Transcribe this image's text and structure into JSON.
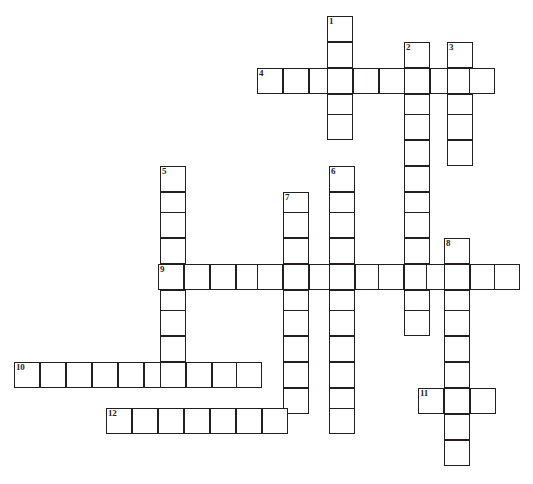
{
  "puzzle": {
    "title": "Crossword Puzzle Grid",
    "cell_size": 26,
    "grid_origin": {
      "x": 14,
      "y": 16
    },
    "colors": {
      "cell_border": "#231f20",
      "cell_fill": "#ffffff",
      "page_background": "#ffffff",
      "number_text": "#231f20"
    },
    "clue_numbers": [
      "1",
      "2",
      "3",
      "4",
      "5",
      "6",
      "7",
      "8",
      "9",
      "10",
      "11",
      "12"
    ],
    "entries": [
      {
        "number": "1",
        "direction": "down",
        "length": 5,
        "start_x": 327,
        "start_y": 16,
        "cells": [
          "",
          "",
          "",
          "",
          ""
        ]
      },
      {
        "number": "2",
        "direction": "down",
        "length": 11,
        "start_x": 404,
        "start_y": 42,
        "cells": [
          "",
          "",
          "",
          "",
          "",
          "",
          "",
          "",
          "",
          "",
          ""
        ]
      },
      {
        "number": "3",
        "direction": "down",
        "length": 5,
        "start_x": 447,
        "start_y": 42,
        "cells": [
          "",
          "",
          "",
          "",
          ""
        ]
      },
      {
        "number": "4",
        "direction": "across",
        "length": 9,
        "start_x": 257,
        "start_y": 68,
        "cells": [
          "",
          "",
          "",
          "",
          "",
          "",
          "",
          "",
          ""
        ]
      },
      {
        "number": "5",
        "direction": "down",
        "length": 9,
        "start_x": 160,
        "start_y": 166,
        "cells": [
          "",
          "",
          "",
          "",
          "",
          "",
          "",
          "",
          ""
        ]
      },
      {
        "number": "6",
        "direction": "down",
        "length": 11,
        "start_x": 329,
        "start_y": 166,
        "cells": [
          "",
          "",
          "",
          "",
          "",
          "",
          "",
          "",
          "",
          "",
          ""
        ]
      },
      {
        "number": "7",
        "direction": "down",
        "length": 9,
        "start_x": 283,
        "start_y": 192,
        "cells": [
          "",
          "",
          "",
          "",
          "",
          "",
          "",
          "",
          ""
        ]
      },
      {
        "number": "8",
        "direction": "down",
        "length": 9,
        "start_x": 444,
        "start_y": 238,
        "cells": [
          "",
          "",
          "",
          "",
          "",
          "",
          "",
          "",
          ""
        ]
      },
      {
        "number": "9",
        "direction": "across",
        "length": 14,
        "start_x": 158,
        "start_y": 264,
        "cells": [
          "",
          "",
          "",
          "",
          "",
          "",
          "",
          "",
          "",
          "",
          "",
          "",
          "",
          ""
        ]
      },
      {
        "number": "10",
        "direction": "across",
        "length": 10,
        "start_x": 14,
        "start_y": 362,
        "cells": [
          "",
          "",
          "",
          "",
          "",
          "",
          "",
          "",
          "",
          ""
        ]
      },
      {
        "number": "11",
        "direction": "across",
        "length": 3,
        "start_x": 418,
        "start_y": 388,
        "cells": [
          "",
          "",
          ""
        ]
      },
      {
        "number": "12",
        "direction": "across",
        "length": 7,
        "start_x": 106,
        "start_y": 408,
        "cells": [
          "",
          "",
          "",
          "",
          "",
          "",
          ""
        ]
      }
    ],
    "cells": [
      {
        "x": 327,
        "y": 16,
        "num": "1"
      },
      {
        "x": 327,
        "y": 42
      },
      {
        "x": 404,
        "y": 42,
        "num": "2"
      },
      {
        "x": 447,
        "y": 42,
        "num": "3"
      },
      {
        "x": 257,
        "y": 68,
        "num": "4"
      },
      {
        "x": 283,
        "y": 68
      },
      {
        "x": 309,
        "y": 68
      },
      {
        "x": 327,
        "y": 68
      },
      {
        "x": 353,
        "y": 68
      },
      {
        "x": 379,
        "y": 68
      },
      {
        "x": 404,
        "y": 68
      },
      {
        "x": 430,
        "y": 68
      },
      {
        "x": 447,
        "y": 68
      },
      {
        "x": 469,
        "y": 68
      },
      {
        "x": 327,
        "y": 94
      },
      {
        "x": 404,
        "y": 94
      },
      {
        "x": 447,
        "y": 94
      },
      {
        "x": 327,
        "y": 114
      },
      {
        "x": 404,
        "y": 114
      },
      {
        "x": 447,
        "y": 114
      },
      {
        "x": 404,
        "y": 140
      },
      {
        "x": 447,
        "y": 140
      },
      {
        "x": 160,
        "y": 166,
        "num": "5"
      },
      {
        "x": 329,
        "y": 166,
        "num": "6"
      },
      {
        "x": 404,
        "y": 166
      },
      {
        "x": 160,
        "y": 192
      },
      {
        "x": 283,
        "y": 192,
        "num": "7"
      },
      {
        "x": 329,
        "y": 192
      },
      {
        "x": 404,
        "y": 192
      },
      {
        "x": 160,
        "y": 212
      },
      {
        "x": 283,
        "y": 212
      },
      {
        "x": 329,
        "y": 212
      },
      {
        "x": 404,
        "y": 212
      },
      {
        "x": 160,
        "y": 238
      },
      {
        "x": 283,
        "y": 238
      },
      {
        "x": 329,
        "y": 238
      },
      {
        "x": 404,
        "y": 238
      },
      {
        "x": 444,
        "y": 238,
        "num": "8"
      },
      {
        "x": 158,
        "y": 264,
        "num": "9"
      },
      {
        "x": 184,
        "y": 264
      },
      {
        "x": 210,
        "y": 264
      },
      {
        "x": 236,
        "y": 264
      },
      {
        "x": 257,
        "y": 264
      },
      {
        "x": 283,
        "y": 264
      },
      {
        "x": 309,
        "y": 264
      },
      {
        "x": 329,
        "y": 264
      },
      {
        "x": 355,
        "y": 264
      },
      {
        "x": 378,
        "y": 264
      },
      {
        "x": 404,
        "y": 264
      },
      {
        "x": 426,
        "y": 264
      },
      {
        "x": 444,
        "y": 264
      },
      {
        "x": 470,
        "y": 264
      },
      {
        "x": 494,
        "y": 264
      },
      {
        "x": 160,
        "y": 290
      },
      {
        "x": 283,
        "y": 290
      },
      {
        "x": 329,
        "y": 290
      },
      {
        "x": 404,
        "y": 290
      },
      {
        "x": 444,
        "y": 290
      },
      {
        "x": 160,
        "y": 310
      },
      {
        "x": 283,
        "y": 310
      },
      {
        "x": 329,
        "y": 310
      },
      {
        "x": 404,
        "y": 310
      },
      {
        "x": 444,
        "y": 310
      },
      {
        "x": 160,
        "y": 336
      },
      {
        "x": 283,
        "y": 336
      },
      {
        "x": 329,
        "y": 336
      },
      {
        "x": 444,
        "y": 336
      },
      {
        "x": 14,
        "y": 362,
        "num": "10"
      },
      {
        "x": 40,
        "y": 362
      },
      {
        "x": 66,
        "y": 362
      },
      {
        "x": 92,
        "y": 362
      },
      {
        "x": 118,
        "y": 362
      },
      {
        "x": 144,
        "y": 362
      },
      {
        "x": 160,
        "y": 362
      },
      {
        "x": 186,
        "y": 362
      },
      {
        "x": 212,
        "y": 362
      },
      {
        "x": 236,
        "y": 362
      },
      {
        "x": 283,
        "y": 362
      },
      {
        "x": 329,
        "y": 362
      },
      {
        "x": 444,
        "y": 362
      },
      {
        "x": 283,
        "y": 388
      },
      {
        "x": 329,
        "y": 388
      },
      {
        "x": 418,
        "y": 388,
        "num": "11"
      },
      {
        "x": 444,
        "y": 388
      },
      {
        "x": 470,
        "y": 388
      },
      {
        "x": 106,
        "y": 408
      },
      {
        "x": 132,
        "y": 408
      },
      {
        "x": 158,
        "y": 408
      },
      {
        "x": 184,
        "y": 408
      },
      {
        "x": 210,
        "y": 408
      },
      {
        "x": 236,
        "y": 408
      },
      {
        "x": 262,
        "y": 408
      },
      {
        "x": 329,
        "y": 408
      },
      {
        "x": 444,
        "y": 414
      },
      {
        "x": 444,
        "y": 440
      }
    ],
    "cell_number_override": {
      "x": 106,
      "y": 408,
      "num": "12"
    }
  }
}
